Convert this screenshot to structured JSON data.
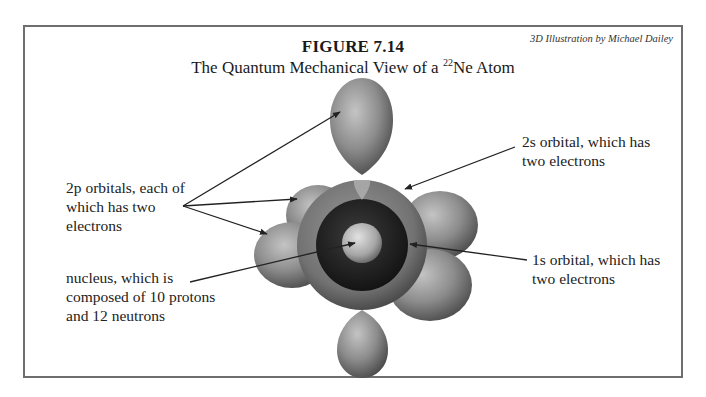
{
  "figure": {
    "credit": "3D Illustration by Michael Dailey",
    "number": "FIGURE 7.14",
    "caption_prefix": "The Quantum Mechanical View of a ",
    "caption_isotope_mass": "22",
    "caption_suffix": "Ne Atom"
  },
  "labels": {
    "p_orbitals": [
      "2p orbitals, each of",
      "which has two",
      "electrons"
    ],
    "nucleus": [
      "nucleus, which is",
      "composed of 10 protons",
      "and 12 neutrons"
    ],
    "s2_orbital": [
      "2s orbital, which has",
      "two electrons"
    ],
    "s1_orbital": [
      "1s orbital, which has",
      "two electrons"
    ]
  },
  "colors": {
    "frame": "#6e6e6e",
    "lobe": "#8a8a8a",
    "shell_2s": "#7a7a7a",
    "shell_1s": "#2e2e2e",
    "nucleus": "#b5b5b5",
    "leader": "#222222"
  }
}
